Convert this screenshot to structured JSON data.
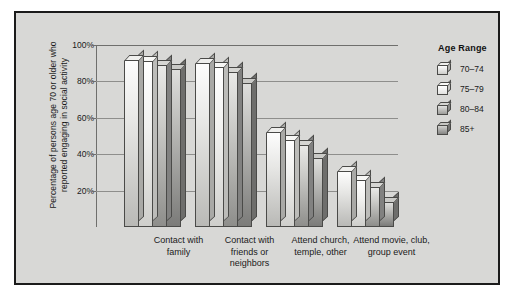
{
  "chart_data": {
    "type": "bar",
    "title": "",
    "xlabel": "",
    "ylabel": "Percentage of persons age 70 or older who\nreported engaging in social activity",
    "ylim": [
      0,
      100
    ],
    "grid": true,
    "legend_position": "right",
    "legend_title": "Age Range",
    "categories": [
      "Contact with\nfamily",
      "Contact with\nfriends or\nneighbors",
      "Attend church,\ntemple, other",
      "Attend movie, club,\ngroup event"
    ],
    "ytick_labels": [
      "100%",
      "80%",
      "60%",
      "40%",
      "20%"
    ],
    "ytick_values": [
      100,
      80,
      60,
      40,
      20
    ],
    "series": [
      {
        "name": "70–74",
        "values": [
          92,
          90,
          52,
          31
        ]
      },
      {
        "name": "75–79",
        "values": [
          91,
          88,
          48,
          26
        ]
      },
      {
        "name": "80–84",
        "values": [
          89,
          85,
          45,
          22
        ]
      },
      {
        "name": "85+",
        "values": [
          87,
          79,
          38,
          14
        ]
      }
    ]
  },
  "colors": {
    "frame_border": "#1b1b1b",
    "panel_background": "#d8d8d6",
    "gridline": "#8e8e8c",
    "text": "#1a1a1a",
    "series_70_74": "#e6e6e4",
    "series_75_79": "#f1f1ef",
    "series_80_84": "#c9c9c6",
    "series_85_plus": "#bcbcb9"
  }
}
